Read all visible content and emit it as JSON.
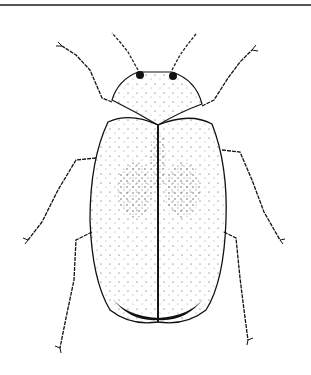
{
  "image": {
    "subject": "beetle",
    "style": "stippled pen-and-ink scientific illustration",
    "view": "dorsal",
    "colors": {
      "background": "#ffffff",
      "ink": "#111111",
      "rule": "#555555"
    },
    "parts": [
      "antennae",
      "eyes",
      "pronotum",
      "elytra",
      "forelegs",
      "midlegs",
      "hindlegs"
    ]
  }
}
